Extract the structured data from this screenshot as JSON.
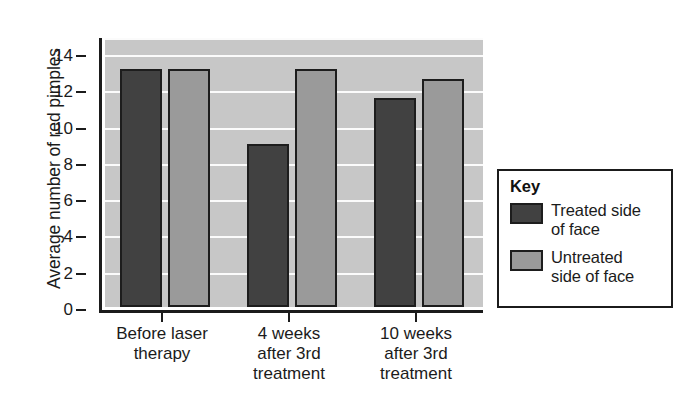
{
  "chart_data": {
    "type": "bar",
    "title": "",
    "xlabel": "",
    "ylabel": "Average number of red pimples",
    "ylim": [
      0,
      15
    ],
    "ytick_values": [
      0,
      2,
      4,
      6,
      8,
      10,
      12,
      14
    ],
    "ytick_labels": [
      "0",
      "2",
      "4",
      "6",
      "8",
      "10",
      "12",
      "14"
    ],
    "grid": true,
    "grid_axis": "y",
    "legend_position": "right-outside",
    "categories": [
      "Before laser therapy",
      "4 weeks after 3rd treatment",
      "10 weeks after 3rd treatment"
    ],
    "category_lines": [
      [
        "Before laser",
        "therapy"
      ],
      [
        "4 weeks",
        "after 3rd",
        "treatment"
      ],
      [
        "10 weeks",
        "after 3rd",
        "treatment"
      ]
    ],
    "series": [
      {
        "name": "Treated side of face",
        "name_lines": [
          "Treated side",
          "of face"
        ],
        "color": "#414141",
        "values": [
          13.1,
          9.0,
          11.5
        ]
      },
      {
        "name": "Untreated side of face",
        "name_lines": [
          "Untreated",
          "side of face"
        ],
        "color": "#9a9a9a",
        "values": [
          13.1,
          13.1,
          12.6
        ]
      }
    ]
  },
  "legend": {
    "title": "Key"
  },
  "colors": {
    "treated": "#414141",
    "untreated": "#9a9a9a",
    "plot_background": "#c7c7c7",
    "gridline": "#fbfbfb",
    "axis": "#1b1b1b",
    "bar_outline": "#1d1d1d"
  }
}
